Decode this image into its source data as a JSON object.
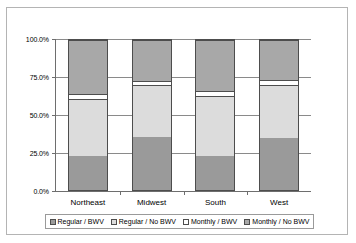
{
  "chart_data": {
    "type": "bar",
    "subtype": "stacked-column-100",
    "title": "",
    "xlabel": "",
    "ylabel": "",
    "categories": [
      "Northeast",
      "Midwest",
      "South",
      "West"
    ],
    "ytick_labels": [
      "0.0%",
      "25.0%",
      "50.0%",
      "75.0%",
      "100.0%"
    ],
    "ytick_values": [
      0,
      25,
      50,
      75,
      100
    ],
    "ylim": [
      0,
      100
    ],
    "grid": true,
    "legend_position": "bottom",
    "series": [
      {
        "name": "Regular / BWV",
        "color": "#9a9a9a",
        "values": [
          23.0,
          35.5,
          23.0,
          35.0
        ]
      },
      {
        "name": "Regular / No BWV",
        "color": "#dcdcdc",
        "values": [
          38.0,
          34.5,
          40.0,
          35.0
        ]
      },
      {
        "name": "Monthly / BWV",
        "color": "#ffffff",
        "values": [
          3.0,
          3.0,
          3.0,
          3.5
        ]
      },
      {
        "name": "Monthly / No BWV",
        "color": "#a8a8a8",
        "values": [
          36.0,
          27.0,
          34.0,
          26.5
        ]
      }
    ]
  },
  "legend": {
    "items": [
      {
        "label": "Regular / BWV",
        "color": "#9a9a9a"
      },
      {
        "label": "Regular / No BWV",
        "color": "#dcdcdc"
      },
      {
        "label": "Monthly / BWV",
        "color": "#ffffff"
      },
      {
        "label": "Monthly / No BWV",
        "color": "#a8a8a8"
      }
    ]
  }
}
